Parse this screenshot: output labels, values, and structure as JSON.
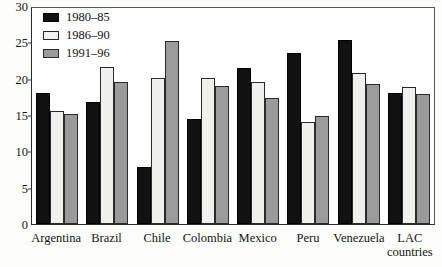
{
  "chart_data": {
    "type": "bar",
    "title": "",
    "subtitle": "",
    "xlabel": "",
    "ylabel": "",
    "ylim": [
      0,
      30
    ],
    "yticks": [
      0,
      5,
      10,
      15,
      20,
      25,
      30
    ],
    "ytick_labels": [
      "0",
      "5",
      "10",
      "15",
      "20",
      "25",
      "30"
    ],
    "grid": false,
    "legend_position": "top-left",
    "categories": [
      "Argentina",
      "Brazil",
      "Chile",
      "Colombia",
      "Mexico",
      "Peru",
      "Venezuela",
      "LAC\ncountries"
    ],
    "series": [
      {
        "name": "1980–85",
        "color": "#111111",
        "values": [
          18.0,
          16.8,
          7.8,
          14.4,
          21.5,
          23.5,
          25.3,
          18.0
        ]
      },
      {
        "name": "1986–90",
        "color": "#f0f0ee",
        "values": [
          15.5,
          21.6,
          20.1,
          20.1,
          19.6,
          14.1,
          20.8,
          18.8
        ]
      },
      {
        "name": "1991–96",
        "color": "#9b9b9b",
        "values": [
          15.2,
          19.5,
          25.2,
          19.0,
          17.3,
          14.9,
          19.3,
          17.9
        ]
      }
    ]
  },
  "legend": {
    "items": [
      {
        "label": "1980–85",
        "swatch": "black-square-swatch"
      },
      {
        "label": "1986–90",
        "swatch": "white-square-swatch"
      },
      {
        "label": "1991–96",
        "swatch": "gray-square-swatch"
      }
    ]
  }
}
